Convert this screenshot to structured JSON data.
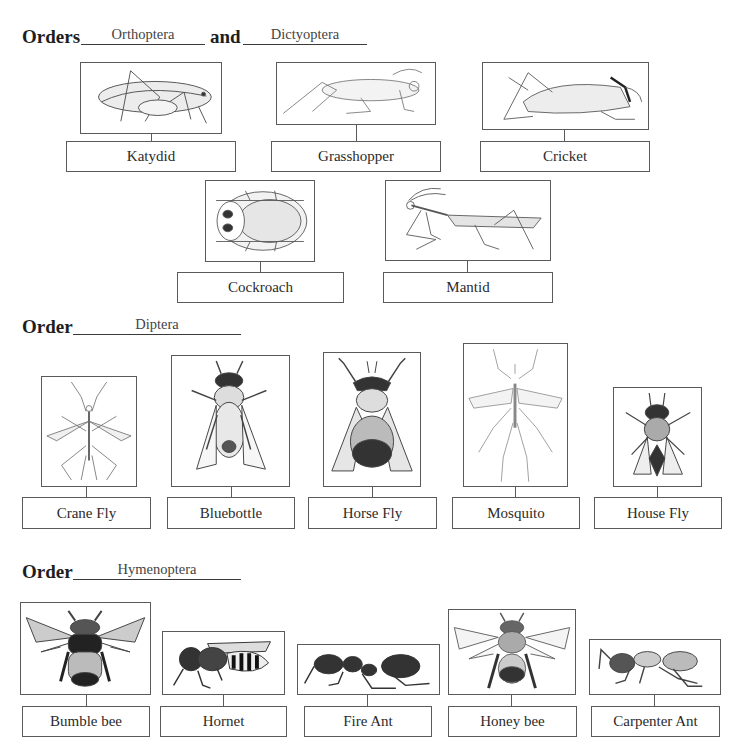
{
  "sections": [
    {
      "heading_word": "Orders",
      "answer_1": "Orthoptera",
      "joiner": "and",
      "answer_2": "Dictyoptera",
      "insects": [
        {
          "name": "Katydid",
          "icon": "katydid-illustration"
        },
        {
          "name": "Grasshopper",
          "icon": "grasshopper-illustration"
        },
        {
          "name": "Cricket",
          "icon": "cricket-illustration"
        },
        {
          "name": "Cockroach",
          "icon": "cockroach-illustration"
        },
        {
          "name": "Mantid",
          "icon": "mantid-illustration"
        }
      ]
    },
    {
      "heading_word": "Order",
      "answer_1": "Diptera",
      "insects": [
        {
          "name": "Crane Fly",
          "icon": "crane-fly-illustration"
        },
        {
          "name": "Bluebottle",
          "icon": "bluebottle-illustration"
        },
        {
          "name": "Horse Fly",
          "icon": "horse-fly-illustration"
        },
        {
          "name": "Mosquito",
          "icon": "mosquito-illustration"
        },
        {
          "name": "House Fly",
          "icon": "house-fly-illustration"
        }
      ]
    },
    {
      "heading_word": "Order",
      "answer_1": "Hymenoptera",
      "insects": [
        {
          "name": "Bumble bee",
          "icon": "bumble-bee-illustration"
        },
        {
          "name": "Hornet",
          "icon": "hornet-illustration"
        },
        {
          "name": "Fire Ant",
          "icon": "fire-ant-illustration"
        },
        {
          "name": "Honey bee",
          "icon": "honey-bee-illustration"
        },
        {
          "name": "Carpenter Ant",
          "icon": "carpenter-ant-illustration"
        }
      ]
    }
  ],
  "colors": {
    "border": "#5a5a5a",
    "text": "#2b2b2b",
    "heading": "#1e1e1e"
  }
}
